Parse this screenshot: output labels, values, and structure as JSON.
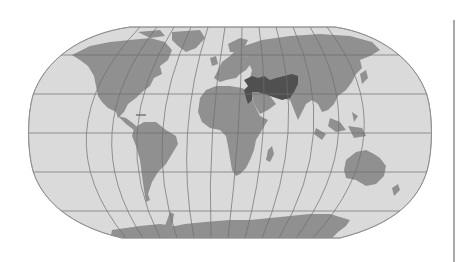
{
  "map": {
    "projection": "robinson",
    "style": "grayscale",
    "colors": {
      "background": "#ffffff",
      "ocean": "#dadada",
      "land": "#909090",
      "highlight": "#505050",
      "graticule": "#6e6e6e",
      "outline": "#8a8a8a",
      "right_rule": "#a8a8a8"
    },
    "graticule": {
      "parallels_interval_deg": 30,
      "meridians_interval_deg": 30
    },
    "highlighted_region": {
      "description": "region spanning Anatolia, Levant, Mesopotamia, Iran to Central Asia",
      "color": "#505050"
    },
    "labels": []
  }
}
